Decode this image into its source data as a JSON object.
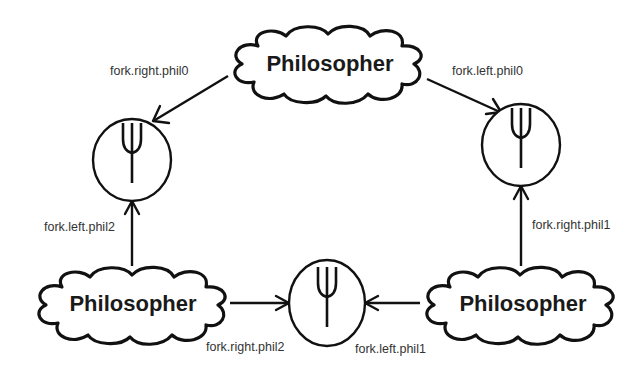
{
  "diagram": {
    "nodes": {
      "phil_top": {
        "label": "Philosopher",
        "shape": "cloud"
      },
      "phil_bottom_left": {
        "label": "Philosopher",
        "shape": "cloud"
      },
      "phil_bottom_right": {
        "label": "Philosopher",
        "shape": "cloud"
      },
      "fork_left": {
        "icon": "fork-icon",
        "shape": "circle"
      },
      "fork_right": {
        "icon": "fork-icon",
        "shape": "circle"
      },
      "fork_bottom": {
        "icon": "fork-icon",
        "shape": "circle"
      }
    },
    "edges": [
      {
        "from": "phil_top",
        "to": "fork_left",
        "label": "fork.right.phil0"
      },
      {
        "from": "phil_top",
        "to": "fork_right",
        "label": "fork.left.phil0"
      },
      {
        "from": "phil_bottom_left",
        "to": "fork_left",
        "label": "fork.left.phil2"
      },
      {
        "from": "phil_bottom_right",
        "to": "fork_right",
        "label": "fork.right.phil1"
      },
      {
        "from": "phil_bottom_left",
        "to": "fork_bottom",
        "label": "fork.right.phil2"
      },
      {
        "from": "phil_bottom_right",
        "to": "fork_bottom",
        "label": "fork.left.phil1"
      }
    ],
    "colors": {
      "stroke": "#111111",
      "label_text": "#333333",
      "node_text": "#1a1a1a",
      "background": "#ffffff"
    }
  }
}
